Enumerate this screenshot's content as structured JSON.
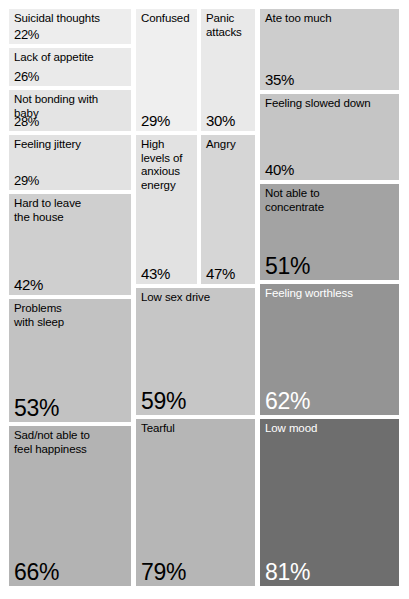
{
  "chart_data": {
    "type": "treemap",
    "title": "",
    "subtitle": "",
    "xlabel": "",
    "ylabel": "",
    "legend": "none",
    "grid": false,
    "value_unit": "%",
    "value_range": [
      22,
      81
    ],
    "color_scale": {
      "description": "greyscale; lighter grey = lower percentage, darker grey = higher percentage",
      "min_color": "#ededed",
      "max_color": "#6e6e6e"
    },
    "categories": [
      "Suicidal thoughts",
      "Lack of appetite",
      "Not bonding with baby",
      "Feeling jittery",
      "Hard to leave the house",
      "Problems with sleep",
      "Sad/not able to feel happiness",
      "Confused",
      "Panic attacks",
      "High levels of anxious energy",
      "Angry",
      "Low sex drive",
      "Tearful",
      "Ate too much",
      "Feeling slowed down",
      "Not able to concentrate",
      "Feeling worthless",
      "Low mood"
    ],
    "values": [
      22,
      26,
      28,
      29,
      42,
      53,
      66,
      29,
      30,
      43,
      47,
      59,
      79,
      35,
      40,
      51,
      62,
      81
    ]
  },
  "tiles": [
    {
      "name": "suicidal-thoughts",
      "label": "Suicidal thoughts",
      "value": "22%",
      "color": "#ededed",
      "text": "dark",
      "size": "sm",
      "x": 9,
      "y": 9,
      "w": 122,
      "h": 35
    },
    {
      "name": "lack-of-appetite",
      "label": "Lack of appetite",
      "value": "26%",
      "color": "#eaeaea",
      "text": "dark",
      "size": "sm",
      "x": 9,
      "y": 48,
      "w": 122,
      "h": 38
    },
    {
      "name": "not-bonding-with-baby",
      "label": "Not bonding with\nbaby",
      "value": "28%",
      "color": "#e4e4e4",
      "text": "dark",
      "size": "sm",
      "x": 9,
      "y": 90,
      "w": 122,
      "h": 41
    },
    {
      "name": "feeling-jittery",
      "label": "Feeling jittery",
      "value": "29%",
      "color": "#e2e2e2",
      "text": "dark",
      "size": "sm",
      "x": 9,
      "y": 135,
      "w": 122,
      "h": 55
    },
    {
      "name": "hard-to-leave-the-house",
      "label": "Hard to leave\nthe house",
      "value": "42%",
      "color": "#cfcfcf",
      "text": "dark",
      "size": "md",
      "x": 9,
      "y": 194,
      "w": 122,
      "h": 101
    },
    {
      "name": "problems-with-sleep",
      "label": "Problems\nwith sleep",
      "value": "53%",
      "color": "#c2c2c2",
      "text": "dark",
      "size": "xl",
      "x": 9,
      "y": 299,
      "w": 122,
      "h": 123
    },
    {
      "name": "sad-not-able-to-feel-happiness",
      "label": "Sad/not able to\nfeel happiness",
      "value": "66%",
      "color": "#b3b3b3",
      "text": "dark",
      "size": "xl",
      "x": 9,
      "y": 426,
      "w": 122,
      "h": 160
    },
    {
      "name": "confused",
      "label": "Confused",
      "value": "29%",
      "color": "#efefef",
      "text": "dark",
      "size": "md",
      "x": 136,
      "y": 9,
      "w": 61,
      "h": 122
    },
    {
      "name": "panic-attacks",
      "label": "Panic\nattacks",
      "value": "30%",
      "color": "#e9e9e9",
      "text": "dark",
      "size": "md",
      "x": 201,
      "y": 9,
      "w": 54,
      "h": 122
    },
    {
      "name": "high-levels-of-anxious-energy",
      "label": "High\nlevels of\nanxious\nenergy",
      "value": "43%",
      "color": "#e2e2e2",
      "text": "dark",
      "size": "md",
      "x": 136,
      "y": 135,
      "w": 61,
      "h": 149
    },
    {
      "name": "angry",
      "label": "Angry",
      "value": "47%",
      "color": "#d6d6d6",
      "text": "dark",
      "size": "md",
      "x": 201,
      "y": 135,
      "w": 54,
      "h": 149
    },
    {
      "name": "low-sex-drive",
      "label": "Low sex drive",
      "value": "59%",
      "color": "#c6c6c6",
      "text": "dark",
      "size": "xl",
      "x": 136,
      "y": 288,
      "w": 119,
      "h": 127
    },
    {
      "name": "tearful",
      "label": "Tearful",
      "value": "79%",
      "color": "#b6b6b6",
      "text": "dark",
      "size": "xl",
      "x": 136,
      "y": 419,
      "w": 119,
      "h": 167
    },
    {
      "name": "ate-too-much",
      "label": "Ate too much",
      "value": "35%",
      "color": "#cdcdcd",
      "text": "dark",
      "size": "md",
      "x": 260,
      "y": 9,
      "w": 139,
      "h": 81
    },
    {
      "name": "feeling-slowed-down",
      "label": "Feeling slowed down",
      "value": "40%",
      "color": "#c5c5c5",
      "text": "dark",
      "size": "md",
      "x": 260,
      "y": 94,
      "w": 139,
      "h": 86
    },
    {
      "name": "not-able-to-concentrate",
      "label": "Not able to\nconcentrate",
      "value": "51%",
      "color": "#a3a3a3",
      "text": "dark",
      "size": "xl",
      "x": 260,
      "y": 184,
      "w": 139,
      "h": 96
    },
    {
      "name": "feeling-worthless",
      "label": "Feeling worthless",
      "value": "62%",
      "color": "#949494",
      "text": "light",
      "size": "xl",
      "x": 260,
      "y": 284,
      "w": 139,
      "h": 131
    },
    {
      "name": "low-mood",
      "label": "Low mood",
      "value": "81%",
      "color": "#6e6e6e",
      "text": "light",
      "size": "xl",
      "x": 260,
      "y": 419,
      "w": 139,
      "h": 167
    }
  ]
}
